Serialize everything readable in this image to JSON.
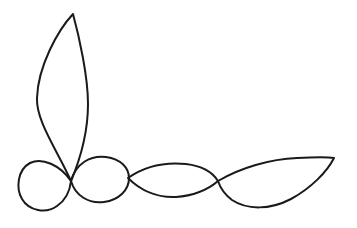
{
  "artwork": {
    "title": "Hand-drawn continuous looping flourish",
    "description": "A single continuous hand-drawn ink line forming a tall narrow petal at upper left, a round loop at lower left, a small rounded loop, and two pointed lens (leaf) shapes increasing in size toward the right, all intersecting near a common node.",
    "medium": "pen-and-ink line drawing",
    "background_color": "#ffffff",
    "ink_color": "#1a1a1a",
    "stroke_width": 2.0,
    "canvas": {
      "width": 357,
      "height": 228
    },
    "crossing_nodes": [
      {
        "name": "main-node",
        "x": 71,
        "y": 181
      },
      {
        "name": "second-node",
        "x": 128,
        "y": 178
      },
      {
        "name": "third-node",
        "x": 218,
        "y": 181
      }
    ],
    "extreme_points": {
      "petal_tip": {
        "x": 73,
        "y": 14
      },
      "left_loop_left": {
        "x": 19,
        "y": 181
      },
      "left_loop_bottom": {
        "x": 50,
        "y": 211
      },
      "right_tip": {
        "x": 334,
        "y": 158
      }
    },
    "shapes": [
      {
        "name": "tall-petal",
        "kind": "petal",
        "path": "M 71 181 C 57 150 36 121 37 98 C 38 66 58 30 73 14 C 79 36 88 76 88 104 C 88 134 79 162 71 181 Z"
      },
      {
        "name": "left-round-loop",
        "kind": "loop",
        "path": "M 71 181 C 60 165 42 157 30 163 C 17 170 16 189 22 199 C 29 211 46 214 57 206 C 66 200 70 190 71 181 Z"
      },
      {
        "name": "small-egg-loop",
        "kind": "loop",
        "path": "M 71 181 C 76 163 91 155 106 157 C 121 159 129 168 129 178 C 129 190 119 200 104 202 C 88 204 75 195 71 181 Z"
      },
      {
        "name": "middle-lens",
        "kind": "lens",
        "path": "M 128 178 C 145 166 166 162 186 164 C 203 166 213 173 218 181 C 208 190 192 196 176 197 C 157 198 140 190 128 178 Z"
      },
      {
        "name": "large-right-lens",
        "kind": "lens",
        "path": "M 218 181 C 240 168 270 159 297 158 C 316 157 328 157 334 158 C 327 172 311 188 291 199 C 270 210 247 210 232 200 C 224 194 220 187 218 181 Z"
      }
    ]
  }
}
